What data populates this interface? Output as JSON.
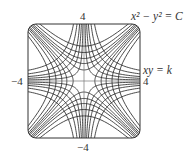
{
  "diagram": {
    "type": "orthogonal-trajectories",
    "title": "",
    "family_1": {
      "equation_label": "x² − y² = C",
      "constants": [
        -6,
        -4,
        -2.5,
        -1.5,
        -0.6,
        0.6,
        1.5,
        2.5,
        4,
        6
      ]
    },
    "family_2": {
      "equation_label": "xy = k",
      "constants": [
        -3,
        -2,
        -1.25,
        -0.75,
        -0.3,
        0.3,
        0.75,
        1.25,
        2,
        3
      ]
    },
    "axes": {
      "xlim": [
        -4,
        4
      ],
      "ylim": [
        -4,
        4
      ],
      "tick_labels": {
        "top": "4",
        "bottom": "−4",
        "left": "−4",
        "right": "4"
      }
    },
    "colors": {
      "curve": "#2b2b2b",
      "axis": "#555555",
      "frame": "#333333"
    }
  }
}
